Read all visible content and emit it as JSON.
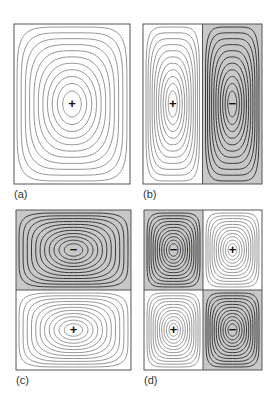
{
  "figure": {
    "colors": {
      "background": "#ffffff",
      "shaded": "#c8c8c8",
      "contour_light": "#6a6a6a",
      "contour_dark": "#3a3a3a",
      "border": "#555555",
      "sign": "#111111"
    },
    "panels": [
      {
        "id": "a",
        "label": "(a)",
        "x": 14,
        "y": 24,
        "w": 116,
        "h": 160,
        "cells": [
          {
            "cx": 0,
            "cy": 0,
            "cw": 1,
            "ch": 1,
            "sign": "+",
            "shaded": false
          }
        ]
      },
      {
        "id": "b",
        "label": "(b)",
        "x": 143,
        "y": 24,
        "w": 119,
        "h": 160,
        "cells": [
          {
            "cx": 0,
            "cy": 0,
            "cw": 0.5,
            "ch": 1,
            "sign": "+",
            "shaded": false
          },
          {
            "cx": 0.5,
            "cy": 0,
            "cw": 0.5,
            "ch": 1,
            "sign": "−",
            "shaded": true
          }
        ]
      },
      {
        "id": "c",
        "label": "(c)",
        "x": 16,
        "y": 210,
        "w": 115,
        "h": 160,
        "cells": [
          {
            "cx": 0,
            "cy": 0,
            "cw": 1,
            "ch": 0.5,
            "sign": "−",
            "shaded": true
          },
          {
            "cx": 0,
            "cy": 0.5,
            "cw": 1,
            "ch": 0.5,
            "sign": "+",
            "shaded": false
          }
        ]
      },
      {
        "id": "d",
        "label": "(d)",
        "x": 144,
        "y": 210,
        "w": 118,
        "h": 160,
        "cells": [
          {
            "cx": 0,
            "cy": 0,
            "cw": 0.5,
            "ch": 0.5,
            "sign": "−",
            "shaded": true
          },
          {
            "cx": 0.5,
            "cy": 0,
            "cw": 0.5,
            "ch": 0.5,
            "sign": "+",
            "shaded": false
          },
          {
            "cx": 0,
            "cy": 0.5,
            "cw": 0.5,
            "ch": 0.5,
            "sign": "+",
            "shaded": false
          },
          {
            "cx": 0.5,
            "cy": 0.5,
            "cw": 0.5,
            "ch": 0.5,
            "sign": "−",
            "shaded": true
          }
        ]
      }
    ],
    "contour_count": 11
  }
}
